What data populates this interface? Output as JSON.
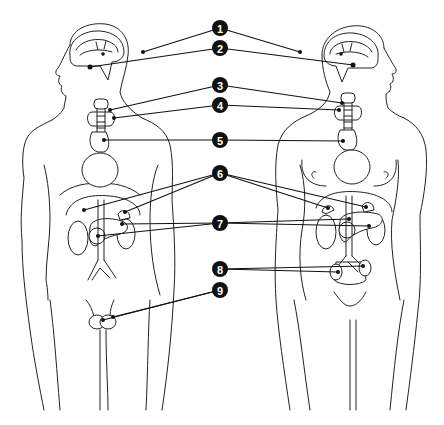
{
  "diagram": {
    "figures": [
      "male",
      "female"
    ],
    "colors": {
      "line": "#222222",
      "badge_fill": "#111111",
      "badge_text": "#ffffff",
      "background": "#ffffff"
    },
    "labels": [
      {
        "number": "1",
        "x": 220,
        "y": 28,
        "targets": [
          [
            143,
            52
          ],
          [
            300,
            52
          ]
        ]
      },
      {
        "number": "2",
        "x": 220,
        "y": 48,
        "targets": [
          [
            90,
            67
          ],
          [
            353,
            65
          ]
        ]
      },
      {
        "number": "3",
        "x": 220,
        "y": 85,
        "targets": [
          [
            110,
            110
          ],
          [
            342,
            103
          ]
        ]
      },
      {
        "number": "4",
        "x": 220,
        "y": 105,
        "targets": [
          [
            114,
            118
          ],
          [
            339,
            110
          ]
        ]
      },
      {
        "number": "5",
        "x": 220,
        "y": 140,
        "targets": [
          [
            104,
            140
          ],
          [
            343,
            141
          ]
        ]
      },
      {
        "number": "6",
        "x": 220,
        "y": 173,
        "targets": [
          [
            84,
            210
          ],
          [
            125,
            212
          ],
          [
            328,
            208
          ],
          [
            366,
            207
          ]
        ]
      },
      {
        "number": "7",
        "x": 220,
        "y": 223,
        "targets": [
          [
            98,
            236
          ],
          [
            122,
            224
          ],
          [
            349,
            219
          ],
          [
            369,
            226
          ]
        ]
      },
      {
        "number": "8",
        "x": 220,
        "y": 269,
        "targets": [
          [
            338,
            272
          ],
          [
            363,
            266
          ]
        ]
      },
      {
        "number": "9",
        "x": 220,
        "y": 290,
        "targets": [
          [
            103,
            320
          ],
          [
            113,
            317
          ]
        ]
      }
    ]
  }
}
